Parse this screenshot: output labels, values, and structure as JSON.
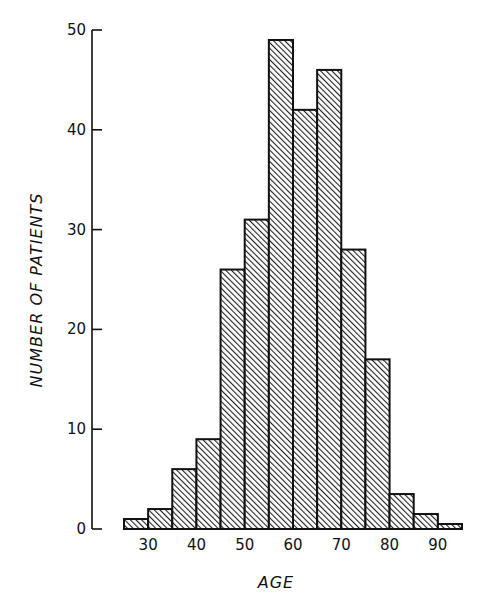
{
  "chart_data": {
    "type": "bar",
    "subtype": "histogram",
    "title": "",
    "xlabel": "AGE",
    "ylabel": "NUMBER OF PATIENTS",
    "bin_width": 5,
    "bin_edges": [
      25,
      30,
      35,
      40,
      45,
      50,
      55,
      60,
      65,
      70,
      75,
      80,
      85,
      90,
      95
    ],
    "categories": [
      "25-30",
      "30-35",
      "35-40",
      "40-45",
      "45-50",
      "50-55",
      "55-60",
      "60-65",
      "65-70",
      "70-75",
      "75-80",
      "80-85",
      "85-90",
      "90-95"
    ],
    "values": [
      1,
      2,
      6,
      9,
      26,
      31,
      49,
      42,
      46,
      28,
      17,
      3.5,
      1.5,
      0.5
    ],
    "xticks": [
      30,
      40,
      50,
      60,
      70,
      80,
      90
    ],
    "yticks": [
      0,
      10,
      20,
      30,
      40,
      50
    ],
    "xlim": [
      25,
      95
    ],
    "ylim": [
      0,
      50
    ],
    "grid": false,
    "legend": null,
    "bar_style": "diagonal-hatched, black outline",
    "colors": {
      "outline": "#111111",
      "hatch": "#222222",
      "background": "#ffffff"
    }
  }
}
